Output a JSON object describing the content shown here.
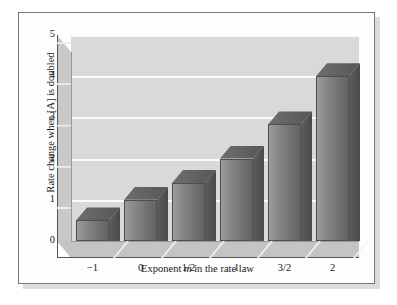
{
  "figure": {
    "background_color": "#fdfdfd",
    "border_color": "#777777",
    "shadow_color": "#dcdcdc"
  },
  "chart_data": {
    "type": "bar",
    "title": "",
    "xlabel_prefix": "Exponent ",
    "xlabel_italic": "m",
    "xlabel_suffix": " in the rate law",
    "ylabel": "Rate change when [A] is doubled",
    "categories": [
      "−1",
      "0",
      "1/2",
      "1",
      "3/2",
      "2"
    ],
    "values": [
      0.5,
      1.0,
      1.41,
      2.0,
      2.83,
      4.0
    ],
    "ylim": [
      0,
      5
    ],
    "ytick_labels": [
      "0",
      "1",
      "2",
      "3",
      "4",
      "5"
    ],
    "ytick_values": [
      0,
      1,
      2,
      3,
      4,
      5
    ],
    "grid": true,
    "grid_color": "#fbfbfb",
    "plot_bg_color": "#d9d9d9",
    "bar_color": "#7e7e7e",
    "bar_style": "3d",
    "legend": null
  }
}
